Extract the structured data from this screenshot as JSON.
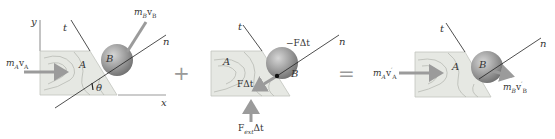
{
  "colors": {
    "block_fill": "#e6e8e3",
    "block_stroke": "#b7b9b3",
    "grain": "#b8bab4",
    "ball_dark": "#7d7d7d",
    "ball_light": "#d2d2d2",
    "arrow": "#9b9b9b",
    "line": "#222222",
    "operator": "#a5a5a5"
  },
  "panels": [
    {
      "name": "before",
      "block_label": "A",
      "ball_label": "B",
      "axis_t": "t",
      "axis_n": "n",
      "axis_x": "x",
      "axis_y": "y",
      "angle": "θ",
      "momentum_a": {
        "m": "m",
        "sub": "A",
        "v": "v",
        "vsub": "A",
        "prime": ""
      },
      "momentum_b": {
        "m": "m",
        "sub": "B",
        "v": "v",
        "vsub": "B",
        "prime": ""
      }
    },
    {
      "name": "impulse",
      "block_label": "A",
      "ball_label": "B",
      "axis_t": "t",
      "axis_n": "n",
      "impulse_on_b": "−FΔt",
      "impulse_on_a": "FΔt",
      "external_impulse": {
        "F": "F",
        "sub": "ext",
        "dt": "Δt"
      }
    },
    {
      "name": "after",
      "block_label": "A",
      "ball_label": "B",
      "axis_t": "t",
      "axis_n": "n",
      "momentum_a": {
        "m": "m",
        "sub": "A",
        "v": "v",
        "vsub": "A",
        "prime": "′"
      },
      "momentum_b": {
        "m": "m",
        "sub": "B",
        "v": "v",
        "vsub": "B",
        "prime": "′"
      }
    }
  ],
  "operators": {
    "plus": "+",
    "equals": "="
  }
}
